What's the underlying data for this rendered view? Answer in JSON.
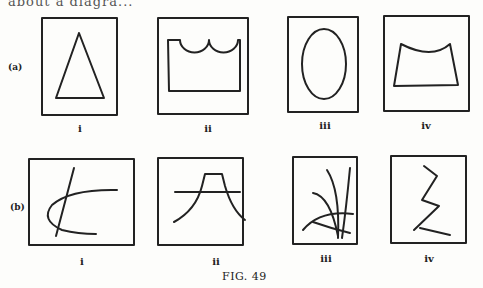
{
  "header_fragment": "about a diagra...",
  "rows": [
    {
      "label": "(a)",
      "items": [
        {
          "caption": "i",
          "shape": "triangle"
        },
        {
          "caption": "ii",
          "shape": "rectangle-with-scalloped-top"
        },
        {
          "caption": "iii",
          "shape": "ellipse"
        },
        {
          "caption": "iv",
          "shape": "trapezoid-with-concave-top"
        }
      ]
    },
    {
      "label": "(b)",
      "items": [
        {
          "caption": "i",
          "shape": "line-crossing-curve"
        },
        {
          "caption": "ii",
          "shape": "flat-topped-arch-with-horizontal-line"
        },
        {
          "caption": "iii",
          "shape": "radiating-curved-strokes"
        },
        {
          "caption": "iv",
          "shape": "zigzag-lines"
        }
      ]
    }
  ],
  "figure_caption": "FIG. 49"
}
